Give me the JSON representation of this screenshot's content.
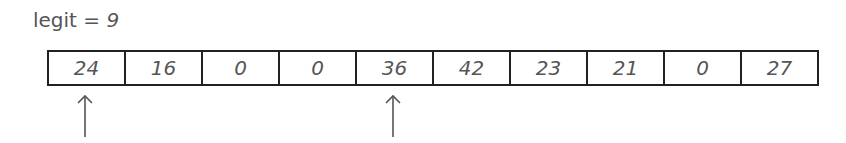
{
  "label": {
    "name": "legit",
    "equals": "=",
    "value": "9"
  },
  "array": {
    "cells": [
      "24",
      "16",
      "0",
      "0",
      "36",
      "42",
      "23",
      "21",
      "0",
      "27"
    ]
  },
  "pointers": [
    {
      "index": 0,
      "icon": "up-arrow-icon"
    },
    {
      "index": 4,
      "icon": "up-arrow-icon"
    }
  ]
}
